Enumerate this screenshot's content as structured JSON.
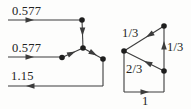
{
  "figure": {
    "name": "winding-current-distribution-figure",
    "background": "#fdfdfc",
    "ink": "#3c3c3c",
    "text_color": "#222222",
    "diagrams": [
      {
        "name": "wye-current-diagram",
        "labels": [
          {
            "name": "current-label-top",
            "text": "0.577",
            "x": 12,
            "y": 14.5
          },
          {
            "name": "current-label-mid",
            "text": "0.577",
            "x": 12,
            "y": 51.5
          },
          {
            "name": "current-label-return",
            "text": "1.15",
            "x": 11,
            "y": 79.5
          }
        ],
        "nodes": [
          {
            "x": 82,
            "y": 20
          },
          {
            "x": 83,
            "y": 48
          },
          {
            "x": 62,
            "y": 57.5
          },
          {
            "x": 103,
            "y": 59
          }
        ],
        "segments": [
          {
            "x1": 8,
            "y1": 20,
            "x2": 82,
            "y2": 20
          },
          {
            "x1": 82,
            "y1": 20,
            "x2": 83,
            "y2": 48
          },
          {
            "x1": 8,
            "y1": 57,
            "x2": 62,
            "y2": 57
          },
          {
            "x1": 62,
            "y1": 57.5,
            "x2": 83,
            "y2": 48
          },
          {
            "x1": 83,
            "y1": 48,
            "x2": 103,
            "y2": 59
          },
          {
            "x1": 103,
            "y1": 59,
            "x2": 103,
            "y2": 86
          },
          {
            "x1": 103,
            "y1": 86,
            "x2": 8,
            "y2": 86
          }
        ],
        "arrows": [
          {
            "x": 34,
            "y": 20,
            "angle": 0
          },
          {
            "x": 82.5,
            "y": 36,
            "angle": 90
          },
          {
            "x": 34,
            "y": 57,
            "angle": 0
          },
          {
            "x": 75.5,
            "y": 51.5,
            "angle": -24
          },
          {
            "x": 97,
            "y": 55.5,
            "angle": 29
          },
          {
            "x": 26,
            "y": 86,
            "angle": 180
          }
        ]
      },
      {
        "name": "delta-current-diagram",
        "labels": [
          {
            "name": "current-label-top-leg",
            "text": "1/3",
            "x": 122,
            "y": 37
          },
          {
            "name": "current-label-right-leg",
            "text": "1/3",
            "x": 167,
            "y": 51
          },
          {
            "name": "current-label-lower-leg",
            "text": "2/3",
            "x": 126,
            "y": 73
          },
          {
            "name": "current-label-line",
            "text": "1",
            "x": 142,
            "y": 105
          }
        ],
        "nodes": [
          {
            "x": 124,
            "y": 51
          },
          {
            "x": 164,
            "y": 26
          },
          {
            "x": 164,
            "y": 71
          }
        ],
        "segments": [
          {
            "x1": 124,
            "y1": 51,
            "x2": 124,
            "y2": 92
          },
          {
            "x1": 124,
            "y1": 92,
            "x2": 164,
            "y2": 92
          },
          {
            "x1": 164,
            "y1": 92,
            "x2": 164,
            "y2": 26
          },
          {
            "x1": 164,
            "y1": 26,
            "x2": 124,
            "y2": 51
          },
          {
            "x1": 164,
            "y1": 71,
            "x2": 124,
            "y2": 51
          }
        ],
        "arrows": [
          {
            "x": 149,
            "y": 92,
            "angle": 0
          },
          {
            "x": 164,
            "y": 41,
            "angle": -90
          },
          {
            "x": 146,
            "y": 37.3,
            "angle": 148
          },
          {
            "x": 144,
            "y": 61,
            "angle": 207
          }
        ]
      }
    ]
  }
}
